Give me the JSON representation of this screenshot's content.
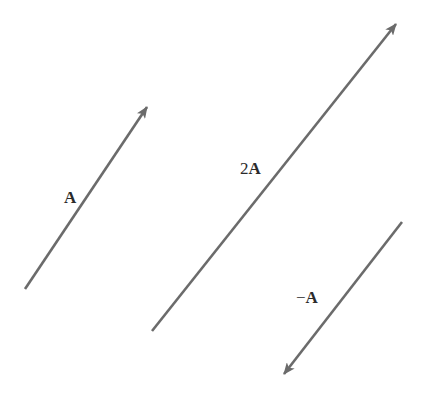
{
  "diagram": {
    "title": "",
    "colors": {
      "vector": "#6b6b6b",
      "label": "#2b2b2b",
      "background": "#ffffff"
    },
    "vectors": [
      {
        "id": "A",
        "label_prefix": "",
        "label_symbol": "A",
        "start": [
          25,
          289
        ],
        "end": [
          147,
          107
        ],
        "label_pos": [
          64,
          189
        ]
      },
      {
        "id": "2A",
        "label_prefix": "2",
        "label_symbol": "A",
        "start": [
          152,
          331
        ],
        "end": [
          396,
          24
        ],
        "label_pos": [
          240,
          160
        ]
      },
      {
        "id": "-A",
        "label_prefix": "−",
        "label_symbol": "A",
        "start": [
          402,
          222
        ],
        "end": [
          284,
          374
        ],
        "label_pos": [
          296,
          289
        ]
      }
    ]
  }
}
